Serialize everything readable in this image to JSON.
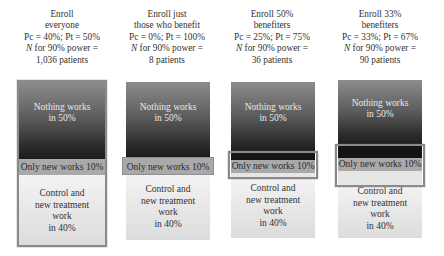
{
  "colors": {
    "nothing_top": "#8c8c8c",
    "nothing_bottom": "#1b1b1b",
    "only_new_band": "#a9a9a9",
    "control_band": "#e6e6e6",
    "highlight_border": "#8a8a8a"
  },
  "columns": [
    {
      "title_lines": [
        "Enroll",
        "everyone"
      ],
      "probabilities": "Pc = 40%; Pt = 50%",
      "n_label_italic": "N",
      "n_label_rest": " for 90% power =",
      "n_value": "1,036 patients",
      "nothing_lines": [
        "Nothing works",
        "in 50%"
      ],
      "only_new": "Only new works 10%",
      "control_lines": [
        "Control and",
        "new treatment",
        "work",
        "in 40%"
      ]
    },
    {
      "title_lines": [
        "Enroll just",
        "those who benefit"
      ],
      "probabilities": "Pc = 0%; Pt = 100%",
      "n_label_italic": "N",
      "n_label_rest": " for 90% power =",
      "n_value": "8 patients",
      "nothing_lines": [
        "Nothing works",
        "in 50%"
      ],
      "only_new": "Only new works 10%",
      "control_lines": [
        "Control and",
        "new treatment",
        "work",
        "in 40%"
      ]
    },
    {
      "title_lines": [
        "Enroll 50%",
        "benefiters"
      ],
      "probabilities": "Pc = 25%; Pt = 75%",
      "n_label_italic": "N",
      "n_label_rest": " for 90% power =",
      "n_value": "36 patients",
      "nothing_lines": [
        "Nothing works",
        "in 50%"
      ],
      "only_new": "Only new works 10%",
      "control_lines": [
        "Control and",
        "new treatment",
        "work",
        "in 40%"
      ]
    },
    {
      "title_lines": [
        "Enroll 33%",
        "benefiters"
      ],
      "probabilities": "Pc = 33%; Pt = 67%",
      "n_label_italic": "N",
      "n_label_rest": " for 90% power =",
      "n_value": "90 patients",
      "nothing_lines": [
        "Nothing works",
        "in 50%"
      ],
      "only_new": "Only new works 10%",
      "control_lines": [
        "Control and",
        "new treatment",
        "work",
        "in 40%"
      ]
    }
  ]
}
